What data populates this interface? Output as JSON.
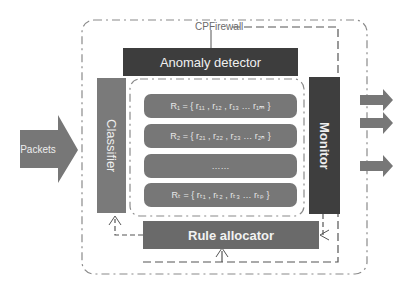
{
  "diagram": {
    "title": "CPFirewall",
    "input_label": "Packets",
    "components": {
      "anomaly_detector": "Anomaly detector",
      "classifier": "Classifier",
      "monitor": "Monitor",
      "rule_allocator": "Rule allocator"
    },
    "rule_sets": [
      {
        "label": "R₁ = { r₁₁ , r₁₂ , r₁₃ … r₁ₘ }"
      },
      {
        "label": "R₂ = { r₂₁ , r₂₂ , r₂₃ … r₂ₙ }"
      },
      {
        "label": "……"
      },
      {
        "label": "Rₜ = { rₜ₁ , rₜ₂ , rₜ₃ … rₜₚ }"
      }
    ],
    "output_arrows": 3,
    "colors": {
      "anomaly_detector": "#3d3d3d",
      "classifier": "#7a7a7a",
      "monitor": "#3e3e3e",
      "rule_allocator": "#6a6a6a",
      "rule_box": "#777777",
      "arrows": "#777777"
    }
  }
}
